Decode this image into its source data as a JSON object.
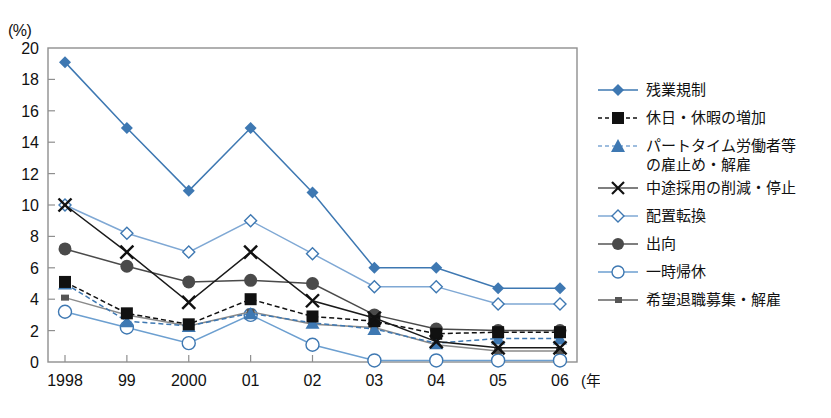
{
  "chart_data": {
    "type": "line",
    "title": "",
    "subtitle": "",
    "unit_label": "(%)",
    "xlabel": "(年)",
    "ylabel": "",
    "grid": false,
    "legend_position": "right",
    "xlim": [
      0,
      8
    ],
    "ylim": [
      0,
      20
    ],
    "ytick_step": 2,
    "yticks": [
      "0",
      "2",
      "4",
      "6",
      "8",
      "10",
      "12",
      "14",
      "16",
      "18",
      "20"
    ],
    "categories": [
      "1998",
      "99",
      "2000",
      "01",
      "02",
      "03",
      "04",
      "05",
      "06"
    ],
    "series": [
      {
        "name": "残業規制",
        "marker": "filled-diamond",
        "line": "solid",
        "color": "#3E78B2",
        "values": [
          19.1,
          14.9,
          10.9,
          14.9,
          10.8,
          6.0,
          6.0,
          4.7,
          4.7
        ]
      },
      {
        "name": "休日・休暇の増加",
        "marker": "filled-square",
        "line": "dashed",
        "color": "#111111",
        "values": [
          5.1,
          3.1,
          2.4,
          4.0,
          2.9,
          2.6,
          1.8,
          1.9,
          1.9
        ]
      },
      {
        "name": "パートタイム労働者等\nの雇止め・解雇",
        "marker": "filled-triangle",
        "line": "dashed",
        "color": "#3E78B2",
        "values": [
          5.0,
          2.6,
          2.3,
          3.1,
          2.5,
          2.1,
          1.2,
          1.5,
          1.5
        ]
      },
      {
        "name": "中途採用の削減・停止",
        "marker": "cross",
        "line": "solid",
        "color": "#1a1a1a",
        "values": [
          10.0,
          7.0,
          3.8,
          7.0,
          3.9,
          2.8,
          1.3,
          0.9,
          0.9
        ]
      },
      {
        "name": "配置転換",
        "marker": "open-diamond",
        "line": "solid",
        "color": "#7FA8D4",
        "values": [
          10.0,
          8.2,
          7.0,
          9.0,
          6.9,
          4.8,
          4.8,
          3.7,
          3.7
        ]
      },
      {
        "name": "出向",
        "marker": "filled-circle",
        "line": "solid",
        "color": "#4a4a4a",
        "values": [
          7.2,
          6.1,
          5.1,
          5.2,
          5.0,
          3.0,
          2.1,
          2.0,
          2.0
        ]
      },
      {
        "name": "一時帰休",
        "marker": "open-circle",
        "line": "solid",
        "color": "#6c9fd0",
        "values": [
          3.2,
          2.2,
          1.2,
          3.0,
          1.1,
          0.1,
          0.1,
          0.1,
          0.1
        ]
      },
      {
        "name": "希望退職募集・解雇",
        "marker": "small-square",
        "line": "solid",
        "color": "#8a8a8a",
        "values": [
          4.1,
          3.0,
          2.3,
          3.2,
          2.4,
          2.2,
          1.1,
          0.7,
          0.7
        ]
      }
    ]
  },
  "legend": {
    "items": [
      {
        "label": "残業規制"
      },
      {
        "label": "休日・休暇の増加"
      },
      {
        "label": "パートタイム労働者等\nの雇止め・解雇"
      },
      {
        "label": "中途採用の削減・停止"
      },
      {
        "label": "配置転換"
      },
      {
        "label": "出向"
      },
      {
        "label": "一時帰休"
      },
      {
        "label": "希望退職募集・解雇"
      }
    ]
  },
  "axes": {
    "unit": "(%)",
    "x_unit": "(年)"
  },
  "colors": {
    "blue_primary": "#3E78B2",
    "blue_light": "#7FA8D4",
    "dark": "#111111",
    "gray": "#4a4a4a",
    "frame": "#8f8f8f"
  }
}
